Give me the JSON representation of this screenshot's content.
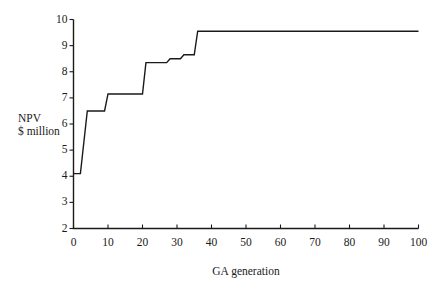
{
  "chart_data": {
    "type": "line",
    "title": "",
    "subtitle": "",
    "xlabel": "GA generation",
    "ylabel_lines": [
      "NPV",
      "$ million"
    ],
    "ylabel": "NPV $ million",
    "xlim": [
      0,
      100
    ],
    "ylim": [
      2,
      10
    ],
    "xticks": [
      0,
      10,
      20,
      30,
      40,
      50,
      60,
      70,
      80,
      90,
      100
    ],
    "xtick_labels": [
      "0",
      "10",
      "20",
      "30",
      "40",
      "50",
      "60",
      "70",
      "80",
      "90",
      "100"
    ],
    "yticks": [
      2,
      3,
      4,
      5,
      6,
      7,
      8,
      9,
      10
    ],
    "ytick_labels": [
      "2",
      "3",
      "4",
      "5",
      "6",
      "7",
      "8",
      "9",
      "10"
    ],
    "grid": false,
    "legend": null,
    "legend_position": "none",
    "line_color": "#1a1a1a",
    "line_width": 1.4,
    "step_style": "post",
    "series": [
      {
        "name": "NPV",
        "x": [
          0,
          1,
          2,
          4,
          5,
          9,
          10,
          20,
          21,
          27,
          28,
          31,
          32,
          35,
          36,
          100
        ],
        "values": [
          4.1,
          4.1,
          4.1,
          6.5,
          6.5,
          6.5,
          7.15,
          7.15,
          8.35,
          8.35,
          8.5,
          8.5,
          8.65,
          8.65,
          9.55,
          9.55
        ]
      }
    ],
    "steps": [
      {
        "generation_start": 0,
        "generation_end": 2,
        "npv": 4.1
      },
      {
        "generation_start": 2,
        "generation_end": 5,
        "npv": 6.5
      },
      {
        "generation_start": 5,
        "generation_end": 10,
        "npv": 6.5
      },
      {
        "generation_start": 10,
        "generation_end": 21,
        "npv": 7.15
      },
      {
        "generation_start": 21,
        "generation_end": 28,
        "npv": 8.35
      },
      {
        "generation_start": 28,
        "generation_end": 32,
        "npv": 8.5
      },
      {
        "generation_start": 32,
        "generation_end": 36,
        "npv": 8.65
      },
      {
        "generation_start": 36,
        "generation_end": 100,
        "npv": 9.55
      }
    ],
    "axis_color": "#1a1a1a",
    "background_color": "#ffffff"
  }
}
